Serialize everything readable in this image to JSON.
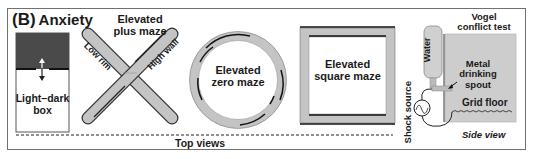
{
  "panel": {
    "label": "(B)",
    "title": "Anxiety"
  },
  "tests": {
    "light_dark_box": {
      "label_line1": "Light–dark",
      "label_line2": "box"
    },
    "plus_maze": {
      "title_line1": "Elevated",
      "title_line2": "plus maze",
      "low_rim": "Low rim",
      "high_wall": "High wall"
    },
    "zero_maze": {
      "line1": "Elevated",
      "line2": "zero maze"
    },
    "square_maze": {
      "line1": "Elevated",
      "line2": "square maze"
    },
    "vogel": {
      "title_line1": "Vogel",
      "title_line2": "conflict test",
      "water": "Water",
      "spout_line1": "Metal",
      "spout_line2": "drinking",
      "spout_line3": "spout",
      "grid_floor": "Grid floor",
      "shock_source": "Shock source",
      "view": "Side view"
    }
  },
  "footer": {
    "top_views": "Top views"
  },
  "colors": {
    "dark_compartment": "#4a4a4a",
    "arm_fill": "#c4c4c4",
    "wall_stroke": "#1a1a1a",
    "frame": "#707070"
  }
}
